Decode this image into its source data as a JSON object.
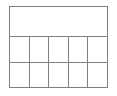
{
  "figure": {
    "kind": "table-grid",
    "border_color": "#808080",
    "cell_fill_color": "#ffffff",
    "page_background_color": "#ffffff",
    "columns": 5,
    "body_rows": 2,
    "header_rows": 1
  },
  "header": {
    "cells": [
      {
        "text": ""
      }
    ]
  },
  "body": {
    "rows": [
      {
        "cells": [
          {
            "text": ""
          },
          {
            "text": ""
          },
          {
            "text": ""
          },
          {
            "text": ""
          },
          {
            "text": ""
          }
        ]
      },
      {
        "cells": [
          {
            "text": ""
          },
          {
            "text": ""
          },
          {
            "text": ""
          },
          {
            "text": ""
          },
          {
            "text": ""
          }
        ]
      }
    ]
  }
}
